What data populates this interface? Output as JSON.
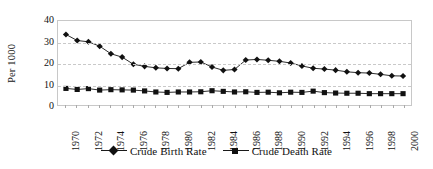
{
  "chart_data": {
    "type": "line",
    "title": "",
    "xlabel": "",
    "ylabel": "Per 1000",
    "ylim": [
      0,
      40
    ],
    "yticks": [
      0,
      10,
      20,
      30,
      40
    ],
    "xlim": [
      1970,
      2000
    ],
    "xticks": [
      1970,
      1972,
      1974,
      1976,
      1978,
      1980,
      1982,
      1984,
      1986,
      1988,
      1990,
      1992,
      1994,
      1996,
      1998,
      2000
    ],
    "grid": "horizontal-dashed",
    "legend_position": "bottom-center",
    "x": [
      1970,
      1971,
      1972,
      1973,
      1974,
      1975,
      1976,
      1977,
      1978,
      1979,
      1980,
      1981,
      1982,
      1983,
      1984,
      1985,
      1986,
      1987,
      1988,
      1989,
      1990,
      1991,
      1992,
      1993,
      1994,
      1995,
      1996,
      1997,
      1998,
      1999,
      2000
    ],
    "series": [
      {
        "name": "Crude Birth Rate",
        "marker": "diamond",
        "color": "#111111",
        "values": [
          33.6,
          30.7,
          30.1,
          28.0,
          24.4,
          22.8,
          19.4,
          18.4,
          17.7,
          17.4,
          17.3,
          20.3,
          20.5,
          18.1,
          16.5,
          16.9,
          21.4,
          21.7,
          21.3,
          20.8,
          20.0,
          18.6,
          17.5,
          17.1,
          16.6,
          15.8,
          15.4,
          15.2,
          14.6,
          13.9,
          13.8
        ]
      },
      {
        "name": "Crude Death Rate",
        "marker": "square",
        "color": "#111111",
        "values": [
          7.9,
          7.4,
          7.8,
          7.1,
          7.3,
          7.2,
          7.1,
          6.7,
          6.2,
          6.0,
          6.2,
          6.2,
          6.3,
          6.8,
          6.5,
          6.2,
          6.3,
          6.0,
          6.1,
          5.8,
          6.1,
          6.0,
          6.6,
          5.9,
          5.7,
          5.6,
          5.6,
          5.4,
          5.4,
          5.4,
          5.4
        ]
      }
    ]
  },
  "axis": {
    "y_label": "Per 1000",
    "y_ticks": [
      "40",
      "30",
      "20",
      "10",
      "0"
    ],
    "x_ticks": [
      "1970",
      "1972",
      "1974",
      "1976",
      "1978",
      "1980",
      "1982",
      "1984",
      "1986",
      "1988",
      "1990",
      "1992",
      "1994",
      "1996",
      "1998",
      "2000"
    ]
  },
  "legend": {
    "entries": [
      {
        "label": "Crude Birth Rate",
        "marker": "diamond"
      },
      {
        "label": "Crude Death Rate",
        "marker": "square"
      }
    ]
  }
}
